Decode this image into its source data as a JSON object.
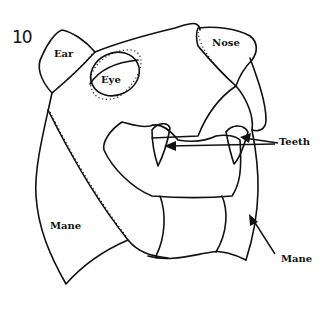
{
  "figure": {
    "number": "10"
  },
  "labels": {
    "ear": "Ear",
    "eye": "Eye",
    "nose": "Nose",
    "teeth": "Teeth",
    "mane_left": "Mane",
    "mane_right": "Mane"
  },
  "colors": {
    "line": "#111111",
    "background": "#ffffff"
  }
}
